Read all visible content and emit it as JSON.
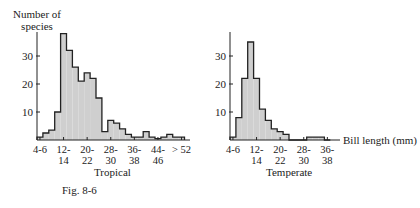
{
  "figure": {
    "caption": "Fig. 8-6",
    "y_label_line1": "Number of",
    "y_label_line2": "species",
    "x_label": "Bill length (mm)"
  },
  "chart_data": [
    {
      "type": "bar",
      "title": "Tropical",
      "xlabel": "Bill length (mm)",
      "ylabel": "Number of species",
      "ylim": [
        0,
        40
      ],
      "yticks": [
        10,
        20,
        30
      ],
      "xtick_labels": [
        "4-6",
        "12-\n14",
        "20-\n22",
        "28-\n30",
        "36-\n38",
        "44-\n46",
        "> 52"
      ],
      "categories": [
        "4-6",
        "6-8",
        "8-10",
        "10-12",
        "12-14",
        "14-16",
        "16-18",
        "18-20",
        "20-22",
        "22-24",
        "24-26",
        "26-28",
        "28-30",
        "30-32",
        "32-34",
        "34-36",
        "36-38",
        "38-40",
        "40-42",
        "42-44",
        "44-46",
        "46-48",
        "48-50",
        "50-52",
        ">52"
      ],
      "values": [
        1,
        2.5,
        3.5,
        10,
        38,
        32,
        26,
        21,
        24,
        22,
        15,
        3,
        7,
        6,
        4,
        2,
        1,
        1,
        3,
        1,
        0.5,
        1,
        2,
        1,
        1
      ],
      "grid": false
    },
    {
      "type": "bar",
      "title": "Temperate",
      "xlabel": "Bill length (mm)",
      "ylabel": "Number of species",
      "ylim": [
        0,
        40
      ],
      "yticks": [
        10,
        20,
        30
      ],
      "xtick_labels": [
        "4-6",
        "12-\n14",
        "20-\n22",
        "28-\n30",
        "36-\n38"
      ],
      "categories": [
        "4-6",
        "6-8",
        "8-10",
        "10-12",
        "12-14",
        "14-16",
        "16-18",
        "18-20",
        "20-22",
        "22-24",
        "24-26",
        "26-28",
        "28-30",
        "30-32",
        "32-34",
        "34-36",
        "36-38"
      ],
      "values": [
        1,
        8,
        22,
        35,
        22,
        11,
        7,
        4,
        3,
        2,
        0,
        0,
        0,
        1,
        1,
        1,
        0
      ],
      "grid": false
    }
  ]
}
